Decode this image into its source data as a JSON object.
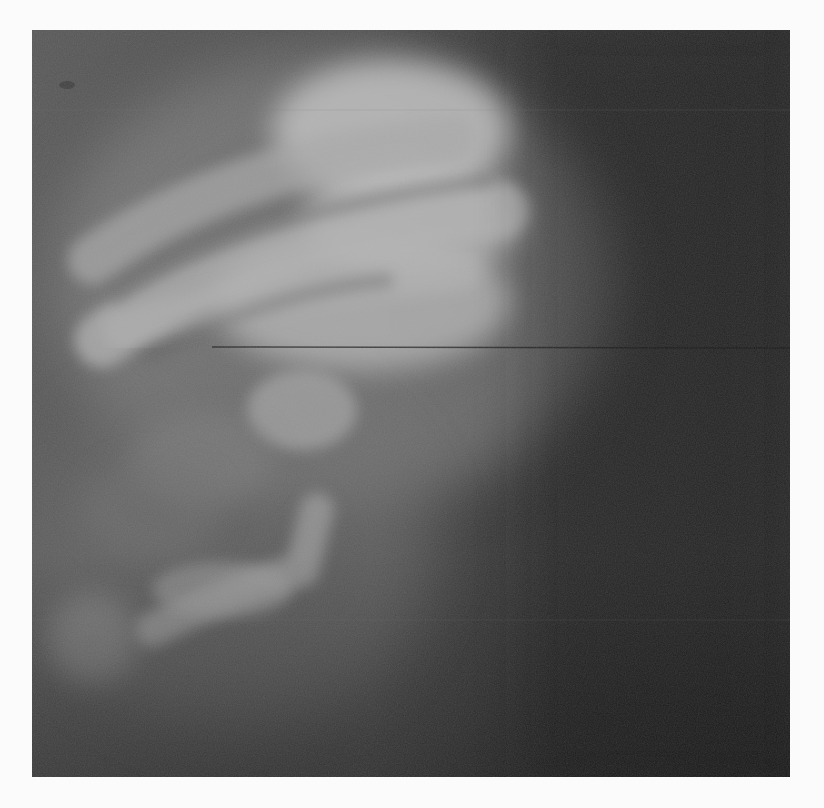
{
  "image": {
    "type": "radiograph",
    "modality": "X-ray",
    "description": "Grayscale radiograph showing curved rib-like bony bands and vertebral densities on the left/center, dark soft tissue field on the right, with a faint horizontal line artifact",
    "background_color": "#fbfbfb",
    "film_base_color": "#2a2a2a",
    "bone_highlight_color": "#bdbdbd",
    "artifact_line_y_px": 347
  }
}
